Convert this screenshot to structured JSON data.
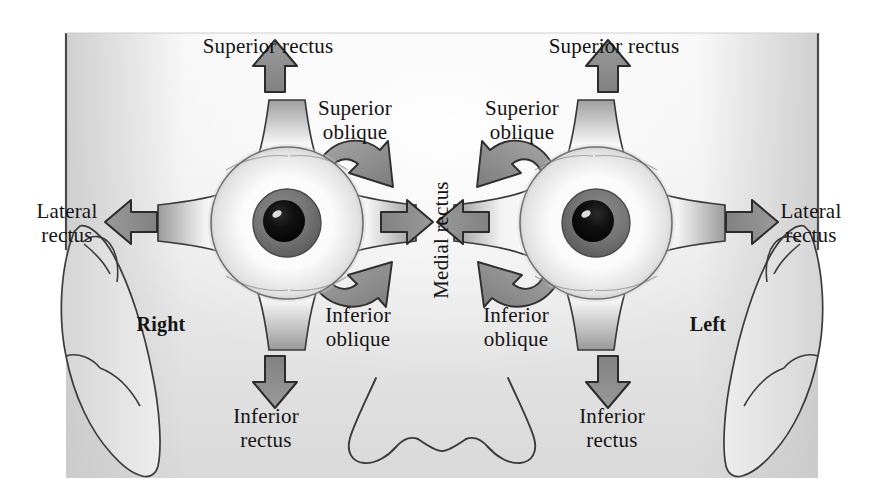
{
  "figure": {
    "type": "anatomical-diagram",
    "view": "anterior view of human face with both eyes",
    "background_color": "#ffffff",
    "face_fill_top": "#f4f4f4",
    "face_fill_bottom": "#d8d8d8",
    "outline_color": "#3a3a3a",
    "arrow_fill": "#8c8c8c",
    "arrow_outline": "#2e2e2e",
    "muscle_fill": "#fdfdfd",
    "muscle_shadow": "#9a9a9a",
    "iris_color": "#6f6f6f",
    "pupil_color": "#101010",
    "text_color": "#141414"
  },
  "side_labels": [
    {
      "name": "right-side-label",
      "text": "Right",
      "x": 131,
      "y": 318
    },
    {
      "name": "left-side-label",
      "text": "Left",
      "x": 683,
      "y": 318
    }
  ],
  "center_label": {
    "name": "medial-rectus-label",
    "text": "Medial rectus",
    "rotation_deg": -90,
    "x": 441,
    "y": 240
  },
  "right_eye": {
    "center_x": 287,
    "center_y": 223,
    "labels": [
      {
        "name": "superior-rectus-label-right",
        "text": "Superior rectus",
        "x": 268,
        "y": 46,
        "align": "center"
      },
      {
        "name": "superior-oblique-label-right",
        "text": "Superior\noblique",
        "x": 355,
        "y": 110,
        "align": "center"
      },
      {
        "name": "lateral-rectus-label-right",
        "text": "Lateral\nrectus",
        "x": 67,
        "y": 211,
        "align": "center"
      },
      {
        "name": "inferior-oblique-label-right",
        "text": "Inferior\noblique",
        "x": 357,
        "y": 316,
        "align": "center"
      },
      {
        "name": "inferior-rectus-label-right",
        "text": "Inferior\nrectus",
        "x": 265,
        "y": 417,
        "align": "center"
      }
    ],
    "arrows": [
      {
        "name": "superior-rectus-arrow-right",
        "direction": "up"
      },
      {
        "name": "inferior-rectus-arrow-right",
        "direction": "down"
      },
      {
        "name": "lateral-rectus-arrow-right",
        "direction": "left"
      },
      {
        "name": "medial-rectus-arrow-right",
        "direction": "right"
      },
      {
        "name": "superior-oblique-arrow-right",
        "direction": "curved-down-right"
      },
      {
        "name": "inferior-oblique-arrow-right",
        "direction": "curved-up-right"
      }
    ]
  },
  "left_eye": {
    "center_x": 596,
    "center_y": 223,
    "labels": [
      {
        "name": "superior-rectus-label-left",
        "text": "Superior rectus",
        "x": 614,
        "y": 46,
        "align": "center"
      },
      {
        "name": "superior-oblique-label-left",
        "text": "Superior\noblique",
        "x": 512,
        "y": 110,
        "align": "center"
      },
      {
        "name": "lateral-rectus-label-left",
        "text": "Lateral\nrectus",
        "x": 809,
        "y": 211,
        "align": "center"
      },
      {
        "name": "inferior-oblique-label-left",
        "text": "Inferior\noblique",
        "x": 512,
        "y": 316,
        "align": "center"
      },
      {
        "name": "inferior-rectus-label-left",
        "text": "Inferior\nrectus",
        "x": 610,
        "y": 417,
        "align": "center"
      }
    ],
    "arrows": [
      {
        "name": "superior-rectus-arrow-left",
        "direction": "up"
      },
      {
        "name": "inferior-rectus-arrow-left",
        "direction": "down"
      },
      {
        "name": "lateral-rectus-arrow-left",
        "direction": "right"
      },
      {
        "name": "medial-rectus-arrow-left",
        "direction": "left"
      },
      {
        "name": "superior-oblique-arrow-left",
        "direction": "curved-down-left"
      },
      {
        "name": "inferior-oblique-arrow-left",
        "direction": "curved-up-left"
      }
    ]
  },
  "anatomy_parts": [
    {
      "name": "face-outline",
      "label": "Face"
    },
    {
      "name": "nose",
      "label": "Nose"
    },
    {
      "name": "right-ear",
      "label": "Right ear"
    },
    {
      "name": "left-ear",
      "label": "Left ear"
    }
  ]
}
